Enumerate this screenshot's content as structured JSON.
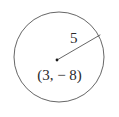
{
  "figure": {
    "type": "geometry-diagram",
    "background_color": "#ffffff",
    "stroke_color": "#555555",
    "text_color": "#2a2a2a",
    "clipped_top_text": "(x - 3) + (y + 8) = 25",
    "circle": {
      "name": "circle",
      "center_x_px": 59,
      "center_y_px": 57,
      "radius_px": 45,
      "stroke_width_px": 0.9
    },
    "center_point": {
      "name": "center-dot",
      "x_px": 57,
      "y_px": 60,
      "size_px": 2.6,
      "label": "(3, − 8)"
    },
    "radius_segment": {
      "name": "radius-line",
      "from_x_px": 57,
      "from_y_px": 60,
      "to_x_px": 100,
      "to_y_px": 35,
      "label": "5",
      "stroke_width_px": 0.9
    }
  },
  "labels": {
    "radius_value": "5",
    "center_coordinates": "(3, − 8)"
  }
}
